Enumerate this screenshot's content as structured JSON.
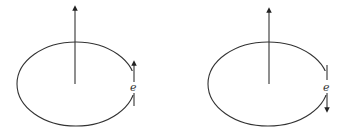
{
  "diagram": {
    "background": "#ffffff",
    "stroke_color": "#333333",
    "panels": [
      {
        "id": "left",
        "orbit": {
          "cx": 76,
          "cy": 84,
          "rx": 59,
          "ry": 42
        },
        "axis_vector": {
          "x": 75,
          "y_from": 84,
          "y_to": 6,
          "direction": "up"
        },
        "electron_label": "e",
        "electron_motion": "up"
      },
      {
        "id": "right",
        "orbit": {
          "cx": 268,
          "cy": 84,
          "rx": 60,
          "ry": 42
        },
        "axis_vector": {
          "x": 269,
          "y_from": 84,
          "y_to": 9,
          "direction": "up"
        },
        "electron_label": "e",
        "electron_motion": "down"
      }
    ]
  }
}
